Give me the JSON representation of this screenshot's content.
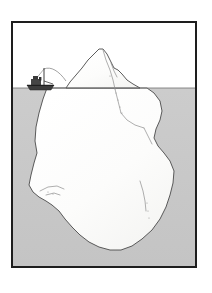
{
  "illustration": {
    "title": "Iceberg cross-section with ship at waterline",
    "caption": "",
    "frame": {
      "border_color": "#1e1e1e",
      "border_width_px": 2,
      "background_color": "#ffffff",
      "x": 11,
      "y": 21,
      "width": 186,
      "height": 247
    },
    "colors": {
      "sky": "#ffffff",
      "water": "#c9c9c9",
      "water_deep": "#c4c4c4",
      "ice_fill": "#fbfbfa",
      "ice_outline": "#4a4a4a",
      "ice_outline_dark": "#3a3a3a",
      "crack_line": "#8d8d8d",
      "waterline": "#6f6f6f",
      "ship_hull": "#3c3c3c",
      "ship_detail": "#2a2a2a",
      "frame_border": "#1e1e1e"
    },
    "waterline": {
      "label": "waterline",
      "y_px": 86,
      "note": "sea surface dividing sky from water"
    },
    "regions": [
      {
        "name": "sky",
        "label": "Sky / air above water",
        "fill": "#ffffff"
      },
      {
        "name": "water",
        "label": "Sea water below waterline",
        "fill": "#c9c9c9"
      },
      {
        "name": "iceberg-tip",
        "label": "Visible iceberg tip above water",
        "fill": "#fbfbfa"
      },
      {
        "name": "iceberg-mass",
        "label": "Submerged iceberg mass",
        "fill": "#fbfbfa"
      }
    ],
    "ship": {
      "label": "Steam trawler at waterline",
      "x_px": 25,
      "y_px": 64,
      "width_px": 33,
      "height_px": 22,
      "parts": [
        "hull",
        "superstructure",
        "funnel",
        "mast",
        "rigging"
      ]
    },
    "iceberg": {
      "label": "Iceberg",
      "tip_peak_x_px": 99,
      "tip_peak_y_px": 47,
      "above_water_span_px": [
        64,
        143
      ],
      "below_water_span_px": [
        32,
        180
      ],
      "deepest_y_px": 250,
      "tip_outline": "M 64,86 L 68,80 L 74,73 L 80,66 L 86,58 L 92,52 L 97,47 L 101,47 L 105,52 L 109,60 L 112,66 L 116,68 L 120,72 L 125,78 L 131,82 L 138,86 Z",
      "mass_outline": "M 45,86 L 41,96 L 37,110 L 34,124 L 33,138 L 35,150 L 32,160 L 29,172 L 27,182 L 31,189 L 37,194 L 44,198 L 50,202 L 57,208 L 63,216 L 70,224 L 78,232 L 87,239 L 97,244 L 108,247 L 119,247 L 130,243 L 140,236 L 150,227 L 158,216 L 164,204 L 168,192 L 171,180 L 172,168 L 168,158 L 162,150 L 156,143 L 152,135 L 154,126 L 158,117 L 160,108 L 158,98 L 152,90 L 145,86 Z",
      "cracks": [
        "M 101,48 L 104,58 L 108,68 L 111,78 L 113,88",
        "M 113,88 L 116,97 L 119,106 L 122,116 L 126,124",
        "M 126,124 L 133,130 L 141,134 L 149,136",
        "M 149,136 L 152,144 L 155,152",
        "M 138,178 L 141,188 L 143,198 L 144,208",
        "M 38,188 L 46,184 L 55,183 L 62,186",
        "M 44,192 L 52,190 L 58,192"
      ],
      "speckles": [
        [
          114,
          92
        ],
        [
          116,
          99
        ],
        [
          118,
          106
        ],
        [
          120,
          112
        ],
        [
          145,
          200
        ],
        [
          146,
          208
        ],
        [
          147,
          215
        ],
        [
          46,
          189
        ],
        [
          51,
          191
        ]
      ]
    }
  }
}
